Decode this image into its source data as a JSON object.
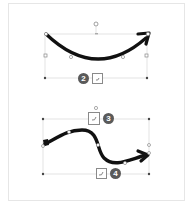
{
  "colors": {
    "arrow": "#111111",
    "selection_line": "#d9d9d9",
    "handle": "#7a7a7a",
    "badge_bg": "#5a5a5a",
    "frame_border": "#e6e6e6"
  },
  "shapes": [
    {
      "name": "curved-arrow-top",
      "callouts": [
        {
          "number": "2"
        }
      ],
      "layout_options_icon": "layout-options-icon"
    },
    {
      "name": "s-curve-arrow-bottom",
      "callouts": [
        {
          "number": "3"
        },
        {
          "number": "4"
        }
      ],
      "layout_options_icon": "layout-options-icon"
    }
  ]
}
